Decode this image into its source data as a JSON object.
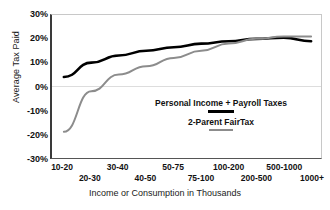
{
  "chart_data": {
    "type": "line",
    "title": "",
    "xlabel": "Income or Consumption in Thousands",
    "ylabel": "Average Tax Paid",
    "categories": [
      "10-20",
      "20-30",
      "30-40",
      "40-50",
      "50-75",
      "75-100",
      "100-200",
      "200-500",
      "500-1000",
      "1000+"
    ],
    "ylim": [
      -30,
      30
    ],
    "ytick_labels": [
      "30%",
      "20%",
      "10%",
      "0%",
      "-10%",
      "-20%",
      "-30%"
    ],
    "ytick_values": [
      30,
      20,
      10,
      0,
      -10,
      -20,
      -30
    ],
    "grid": "zero-line-only",
    "legend_position": "center-right-inside",
    "series": [
      {
        "name": "Personal Income + Payroll Taxes",
        "color": "#000000",
        "width": 2.6,
        "values": [
          4,
          10,
          13,
          15,
          16.5,
          18,
          19,
          20,
          20.5,
          19
        ]
      },
      {
        "name": "2-Parent FairTax",
        "color": "#8c8c8c",
        "width": 2.0,
        "values": [
          -19,
          -2,
          5,
          8.5,
          12,
          15,
          18,
          20,
          21,
          21
        ]
      }
    ]
  },
  "axis": {
    "y_title": "Average Tax Paid",
    "x_title": "Income or Consumption in Thousands"
  },
  "legend": {
    "entries": [
      {
        "label": "Personal Income + Payroll Taxes",
        "color": "#000000"
      },
      {
        "label": "2-Parent FairTax",
        "color": "#8c8c8c"
      }
    ]
  },
  "colors": {
    "series_primary": "#000000",
    "series_secondary": "#8c8c8c",
    "axis": "#3a3a3a",
    "gridline": "#dcdcdc",
    "background": "#ffffff"
  }
}
